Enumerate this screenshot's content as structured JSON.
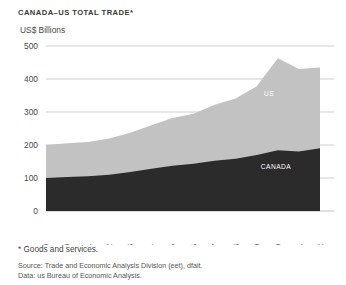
{
  "chart_title": "CANADA–US TOTAL TRADE*",
  "axis_unit_label": "US$ Billions",
  "footnote": "* Goods and services.",
  "source_line": "Source: Trade and Economic Analysis Division (eet), dfait.",
  "data_line": "Data: us Bureau of Economic Analysis.",
  "colors": {
    "us_area": "#c2c2c2",
    "canada_area": "#2b2b2b",
    "gridline": "#b9b9b9",
    "text": "#4a4a4a",
    "background": "#ffffff"
  },
  "chart_data": {
    "type": "area",
    "stacked": true,
    "title": "CANADA–US TOTAL TRADE*",
    "subtitle": "US$ Billions",
    "xlabel": "",
    "ylabel": "US$ Billions",
    "ylim": [
      0,
      500
    ],
    "yticks": [
      0,
      100,
      200,
      300,
      400,
      500
    ],
    "grid": true,
    "legend": "inline-area-labels",
    "categories": [
      "1989",
      "1990",
      "1991",
      "1992",
      "1993",
      "1994",
      "1995",
      "1996",
      "1997",
      "1998",
      "1999",
      "2000",
      "2001",
      "2002"
    ],
    "series": [
      {
        "name": "CANADA",
        "color": "#2b2b2b",
        "values": [
          100,
          103,
          105,
          110,
          118,
          128,
          137,
          143,
          152,
          158,
          170,
          184,
          180,
          190
        ]
      },
      {
        "name": "US",
        "color": "#c2c2c2",
        "values": [
          100,
          102,
          104,
          110,
          119,
          132,
          145,
          152,
          170,
          183,
          208,
          279,
          250,
          245
        ]
      }
    ],
    "totals": [
      200,
      205,
      209,
      220,
      237,
      260,
      282,
      295,
      322,
      341,
      378,
      463,
      430,
      435
    ],
    "peak": {
      "year": "2000",
      "value": 463
    },
    "annotations": [
      {
        "text": "US",
        "series": "US"
      },
      {
        "text": "CANADA",
        "series": "CANADA"
      }
    ]
  }
}
